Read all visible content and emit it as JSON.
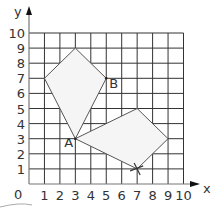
{
  "diagram": {
    "type": "coordinate-grid",
    "axes": {
      "x_label": "x",
      "y_label": "y",
      "origin_label": "0",
      "x_ticks": [
        "1",
        "2",
        "3",
        "4",
        "5",
        "6",
        "7",
        "8",
        "9",
        "10"
      ],
      "y_ticks": [
        "1",
        "2",
        "3",
        "4",
        "5",
        "6",
        "7",
        "8",
        "9",
        "10"
      ],
      "x_range": [
        0,
        10
      ],
      "y_range": [
        0,
        10
      ]
    },
    "shapes": [
      {
        "name": "kite",
        "vertices": [
          [
            3,
            9
          ],
          [
            5,
            7
          ],
          [
            3,
            3
          ],
          [
            1,
            7
          ]
        ],
        "fill": "#f5f5f5",
        "stroke": "#555555"
      },
      {
        "name": "quadrilateral",
        "vertices": [
          [
            3,
            3
          ],
          [
            7,
            5
          ],
          [
            9,
            3
          ],
          [
            7,
            1
          ]
        ],
        "fill": "#f5f5f5",
        "stroke": "#555555"
      }
    ],
    "points": [
      {
        "label": "A",
        "x": 3,
        "y": 3
      },
      {
        "label": "B",
        "x": 5,
        "y": 7
      }
    ],
    "markers": [
      {
        "type": "cross",
        "x": 7,
        "y": 1
      }
    ],
    "colors": {
      "grid": "#333333",
      "axis": "#777777",
      "shape_fill": "#f5f5f5",
      "shape_stroke": "#555555"
    }
  }
}
